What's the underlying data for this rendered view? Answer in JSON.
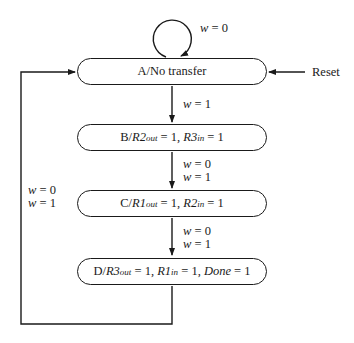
{
  "diagram": {
    "type": "state-diagram",
    "states": [
      {
        "id": "A",
        "name": "A",
        "output": "No transfer"
      },
      {
        "id": "B",
        "name": "B",
        "outputs": [
          {
            "signal": "R2",
            "sub": "out",
            "value": "1"
          },
          {
            "signal": "R3",
            "sub": "in",
            "value": "1"
          }
        ]
      },
      {
        "id": "C",
        "name": "C",
        "outputs": [
          {
            "signal": "R1",
            "sub": "out",
            "value": "1"
          },
          {
            "signal": "R2",
            "sub": "in",
            "value": "1"
          }
        ]
      },
      {
        "id": "D",
        "name": "D",
        "outputs": [
          {
            "signal": "R3",
            "sub": "out",
            "value": "1"
          },
          {
            "signal": "R1",
            "sub": "in",
            "value": "1"
          },
          {
            "signal": "Done",
            "sub": "",
            "value": "1"
          }
        ]
      }
    ],
    "transitions": [
      {
        "from": "A",
        "to": "A",
        "labels": [
          "w = 0"
        ]
      },
      {
        "from": "A",
        "to": "B",
        "labels": [
          "w = 1"
        ]
      },
      {
        "from": "B",
        "to": "C",
        "labels": [
          "w = 0",
          "w = 1"
        ]
      },
      {
        "from": "C",
        "to": "D",
        "labels": [
          "w = 0",
          "w = 1"
        ]
      },
      {
        "from": "D",
        "to": "A",
        "labels": [
          "w = 0",
          "w = 1"
        ]
      }
    ],
    "reset": {
      "label": "Reset",
      "target": "A"
    },
    "text": {
      "a_name": "A/No transfer",
      "slash": "/",
      "eq1": " = 1, ",
      "eq_end": " = 1",
      "w": "w",
      "eq0": " = 0",
      "eq1s": " = 1"
    }
  }
}
